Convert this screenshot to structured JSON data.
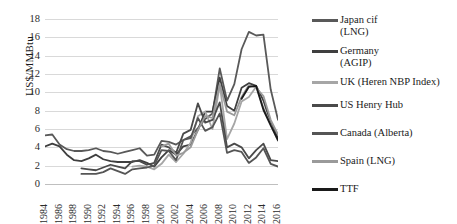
{
  "chart_data": {
    "type": "line",
    "title": "",
    "xlabel": "",
    "ylabel": "US$/MMBtu",
    "ylim": [
      0,
      18
    ],
    "ytick_step": 2,
    "yticks": [
      18,
      16,
      14,
      12,
      10,
      8,
      6,
      4,
      2,
      0
    ],
    "grid": true,
    "legend_position": "right",
    "x": [
      1984,
      1985,
      1986,
      1987,
      1988,
      1989,
      1990,
      1991,
      1992,
      1993,
      1994,
      1995,
      1996,
      1997,
      1998,
      1999,
      2000,
      2001,
      2002,
      2003,
      2004,
      2005,
      2006,
      2007,
      2008,
      2009,
      2010,
      2011,
      2012,
      2013,
      2014,
      2015,
      2016
    ],
    "xtick_labels": [
      "1984",
      "1986",
      "1988",
      "1990",
      "1992",
      "1994",
      "1996",
      "1998",
      "2000",
      "2002",
      "2004",
      "2006",
      "2008",
      "2010",
      "2012",
      "2014",
      "2016"
    ],
    "series": [
      {
        "name": "Japan cif (LNG)",
        "color": "#595959",
        "width": 1.8,
        "values": [
          5.3,
          5.4,
          4.3,
          3.8,
          3.6,
          3.6,
          3.7,
          3.9,
          3.6,
          3.5,
          3.3,
          3.5,
          3.7,
          3.9,
          3.1,
          3.2,
          4.7,
          4.6,
          4.3,
          4.8,
          5.2,
          6.1,
          7.1,
          7.7,
          12.6,
          9.1,
          10.9,
          14.7,
          16.6,
          16.2,
          16.3,
          10.3,
          7.0
        ]
      },
      {
        "name": "Germany (AGIP)",
        "color": "#3f3f3f",
        "width": 1.8,
        "values": [
          4.1,
          4.4,
          4.1,
          3.2,
          2.6,
          2.5,
          2.8,
          3.2,
          2.7,
          2.5,
          2.4,
          2.4,
          2.4,
          2.6,
          2.3,
          1.9,
          2.9,
          3.7,
          3.2,
          4.1,
          4.3,
          5.9,
          7.9,
          7.9,
          11.6,
          8.5,
          8.0,
          10.5,
          11.0,
          10.7,
          9.1,
          6.7,
          5.0
        ]
      },
      {
        "name": "UK (Heren NBP Index)",
        "color": "#a6a6a6",
        "width": 1.8,
        "values": [
          null,
          null,
          null,
          null,
          null,
          null,
          null,
          null,
          null,
          null,
          null,
          null,
          1.9,
          2.0,
          1.9,
          1.6,
          2.2,
          3.2,
          2.4,
          3.3,
          4.5,
          7.4,
          7.9,
          6.0,
          10.8,
          4.9,
          6.6,
          9.0,
          9.5,
          10.6,
          8.3,
          6.5,
          4.7
        ]
      },
      {
        "name": "US Henry Hub",
        "color": "#4a4a4a",
        "width": 1.8,
        "values": [
          null,
          null,
          null,
          null,
          null,
          1.7,
          1.6,
          1.5,
          1.8,
          2.1,
          1.9,
          1.7,
          2.5,
          2.5,
          2.1,
          2.3,
          4.3,
          4.0,
          3.4,
          5.5,
          5.9,
          8.8,
          6.7,
          7.0,
          8.9,
          4.0,
          4.4,
          4.0,
          2.8,
          3.7,
          4.4,
          2.6,
          2.5
        ]
      },
      {
        "name": "Canada (Alberta)",
        "color": "#555555",
        "width": 1.8,
        "values": [
          null,
          null,
          null,
          null,
          null,
          1.1,
          1.1,
          1.1,
          1.3,
          1.7,
          1.4,
          1.1,
          1.6,
          1.7,
          1.8,
          2.0,
          3.7,
          3.6,
          2.6,
          4.8,
          5.0,
          7.2,
          5.8,
          6.2,
          7.7,
          3.4,
          3.7,
          3.5,
          2.3,
          2.9,
          3.9,
          2.2,
          1.9
        ]
      },
      {
        "name": "Spain (LNG)",
        "color": "#9a9a9a",
        "width": 1.8,
        "values": [
          null,
          null,
          null,
          null,
          null,
          null,
          null,
          null,
          null,
          null,
          null,
          null,
          null,
          null,
          null,
          null,
          4.1,
          4.4,
          3.1,
          3.4,
          4.0,
          5.9,
          7.4,
          7.2,
          10.9,
          7.9,
          7.5,
          9.5,
          10.8,
          10.5,
          9.6,
          7.0,
          5.4
        ]
      },
      {
        "name": "TTF",
        "color": "#1a1a1a",
        "width": 1.9,
        "values": [
          null,
          null,
          null,
          null,
          null,
          null,
          null,
          null,
          null,
          null,
          null,
          null,
          null,
          null,
          null,
          null,
          null,
          null,
          null,
          null,
          null,
          null,
          null,
          null,
          null,
          null,
          null,
          9.3,
          10.6,
          10.7,
          8.1,
          6.4,
          4.8
        ]
      }
    ]
  },
  "legend": {
    "items": [
      {
        "label": "Japan cif\n(LNG)"
      },
      {
        "label": "Germany\n(AGIP)"
      },
      {
        "label": "UK (Heren NBP Index)"
      },
      {
        "label": "US Henry Hub"
      },
      {
        "label": "Canada (Alberta)"
      },
      {
        "label": "Spain (LNG)"
      },
      {
        "label": "TTF"
      }
    ]
  }
}
